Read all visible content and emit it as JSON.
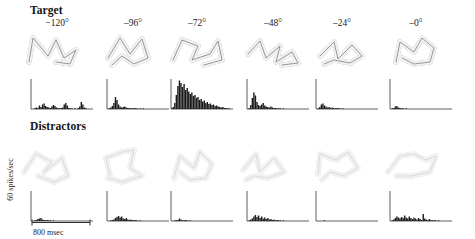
{
  "figure": {
    "width": 475,
    "height": 239,
    "background": "#ffffff"
  },
  "rows": [
    {
      "id": "target",
      "title": "Target",
      "title_x": 30,
      "title_y": 4
    },
    {
      "id": "distractors",
      "title": "Distractors",
      "title_x": 30,
      "title_y": 120
    }
  ],
  "angles": [
    "−120°",
    "–96°",
    "–72°",
    "–48°",
    "–24°",
    "–0°"
  ],
  "column_centers": [
    57,
    133,
    197,
    273,
    342,
    416
  ],
  "axes": {
    "y_label": "60 spikes/sec",
    "x_label": "800 msec",
    "y_label_color": "#1a1a1a",
    "x_label_color": "#1a1a1a"
  },
  "colors": {
    "target_shape_stroke": "#4a4a4a",
    "distractor_shape_stroke": "#b4b4b4",
    "shape_fill": "#f2f2f2",
    "histogram_fill": "#1b1b1b",
    "axis_stroke": "#4d4d4d"
  },
  "chart_data": {
    "type": "bar",
    "xlabel": "800 msec",
    "ylabel": "60 spikes/sec",
    "categories": [
      "−120°",
      "–96°",
      "–72°",
      "–48°",
      "–24°",
      "–0°"
    ],
    "ylim": [
      0,
      60
    ],
    "xlim": [
      0,
      800
    ],
    "grid": false,
    "legend": "none",
    "bin_count": 40,
    "panels": [
      {
        "row": "Target",
        "angle": "−120°",
        "peak_rate": 17,
        "values": [
          0,
          0,
          1,
          3,
          2,
          7,
          4,
          9,
          11,
          6,
          4,
          3,
          2,
          5,
          8,
          6,
          3,
          2,
          1,
          2,
          3,
          9,
          12,
          7,
          2,
          1,
          1,
          0,
          1,
          0,
          2,
          5,
          14,
          9,
          3,
          1,
          0,
          0,
          0,
          0
        ]
      },
      {
        "row": "Target",
        "angle": "–96°",
        "peak_rate": 26,
        "values": [
          0,
          1,
          3,
          6,
          12,
          24,
          18,
          9,
          5,
          3,
          4,
          5,
          3,
          2,
          2,
          1,
          1,
          2,
          1,
          1,
          0,
          1,
          0,
          1,
          0,
          0,
          0,
          0,
          0,
          0,
          0,
          0,
          0,
          0,
          0,
          0,
          0,
          0,
          0,
          0
        ]
      },
      {
        "row": "Target",
        "angle": "–72°",
        "peak_rate": 58,
        "values": [
          1,
          4,
          12,
          28,
          46,
          57,
          52,
          44,
          50,
          38,
          42,
          35,
          30,
          33,
          26,
          28,
          22,
          24,
          18,
          20,
          15,
          17,
          12,
          14,
          10,
          11,
          8,
          9,
          6,
          7,
          5,
          4,
          3,
          4,
          2,
          2,
          1,
          1,
          0,
          0
        ]
      },
      {
        "row": "Target",
        "angle": "–48°",
        "peak_rate": 33,
        "values": [
          0,
          2,
          8,
          22,
          33,
          27,
          14,
          8,
          6,
          9,
          12,
          7,
          5,
          4,
          3,
          5,
          3,
          2,
          2,
          1,
          1,
          1,
          0,
          1,
          0,
          0,
          0,
          0,
          0,
          0,
          0,
          0,
          0,
          0,
          0,
          0,
          0,
          0,
          0,
          0
        ]
      },
      {
        "row": "Target",
        "angle": "–24°",
        "peak_rate": 11,
        "values": [
          0,
          1,
          4,
          9,
          11,
          7,
          5,
          3,
          4,
          2,
          3,
          2,
          1,
          2,
          1,
          1,
          0,
          1,
          0,
          0,
          0,
          0,
          0,
          0,
          0,
          0,
          0,
          0,
          0,
          0,
          0,
          0,
          0,
          0,
          0,
          0,
          0,
          0,
          0,
          0
        ]
      },
      {
        "row": "Target",
        "angle": "–0°",
        "peak_rate": 6,
        "values": [
          0,
          1,
          2,
          5,
          6,
          3,
          2,
          1,
          1,
          0,
          1,
          0,
          0,
          0,
          0,
          0,
          0,
          0,
          0,
          0,
          0,
          0,
          0,
          0,
          0,
          0,
          0,
          0,
          0,
          0,
          0,
          0,
          0,
          0,
          0,
          0,
          0,
          0,
          0,
          0
        ]
      },
      {
        "row": "Distractors",
        "angle": "−120°",
        "peak_rate": 6,
        "values": [
          0,
          0,
          1,
          2,
          4,
          5,
          6,
          3,
          2,
          1,
          2,
          1,
          1,
          0,
          1,
          0,
          0,
          0,
          0,
          0,
          0,
          0,
          0,
          0,
          0,
          0,
          0,
          0,
          0,
          0,
          0,
          0,
          0,
          0,
          0,
          0,
          0,
          0,
          0,
          0
        ]
      },
      {
        "row": "Distractors",
        "angle": "–96°",
        "peak_rate": 10,
        "values": [
          0,
          0,
          1,
          2,
          3,
          6,
          8,
          10,
          7,
          9,
          5,
          4,
          6,
          3,
          2,
          3,
          1,
          2,
          1,
          1,
          0,
          1,
          0,
          0,
          0,
          0,
          0,
          0,
          0,
          0,
          0,
          0,
          0,
          0,
          0,
          0,
          0,
          0,
          0,
          0
        ]
      },
      {
        "row": "Distractors",
        "angle": "–72°",
        "peak_rate": 5,
        "values": [
          0,
          0,
          1,
          1,
          2,
          5,
          3,
          1,
          1,
          2,
          1,
          0,
          1,
          0,
          0,
          0,
          0,
          0,
          0,
          0,
          0,
          0,
          0,
          0,
          0,
          0,
          0,
          0,
          0,
          0,
          0,
          0,
          0,
          0,
          0,
          0,
          0,
          0,
          0,
          0
        ]
      },
      {
        "row": "Distractors",
        "angle": "–48°",
        "peak_rate": 12,
        "values": [
          0,
          1,
          3,
          5,
          9,
          12,
          8,
          11,
          6,
          9,
          5,
          7,
          4,
          6,
          3,
          4,
          2,
          3,
          1,
          2,
          1,
          1,
          0,
          1,
          0,
          0,
          0,
          0,
          0,
          0,
          0,
          0,
          0,
          0,
          0,
          0,
          0,
          0,
          0,
          0
        ]
      },
      {
        "row": "Distractors",
        "angle": "–24°",
        "peak_rate": 1,
        "values": [
          0,
          0,
          0,
          0,
          0,
          1,
          0,
          0,
          0,
          0,
          0,
          0,
          0,
          0,
          0,
          0,
          0,
          0,
          0,
          0,
          0,
          0,
          0,
          0,
          0,
          0,
          0,
          0,
          0,
          0,
          0,
          0,
          0,
          0,
          0,
          0,
          0,
          0,
          0,
          0
        ]
      },
      {
        "row": "Distractors",
        "angle": "–0°",
        "peak_rate": 14,
        "values": [
          0,
          1,
          3,
          6,
          9,
          7,
          5,
          8,
          6,
          11,
          7,
          5,
          9,
          6,
          4,
          7,
          5,
          3,
          6,
          4,
          2,
          14,
          5,
          3,
          2,
          4,
          2,
          1,
          1,
          1,
          0,
          1,
          0,
          0,
          0,
          0,
          0,
          0,
          0,
          0
        ]
      }
    ]
  },
  "stimuli": [
    {
      "row": "target",
      "angle": "−120°",
      "name": "wireframe-object-target-120"
    },
    {
      "row": "target",
      "angle": "–96°",
      "name": "wireframe-object-target-96"
    },
    {
      "row": "target",
      "angle": "–72°",
      "name": "wireframe-object-target-72"
    },
    {
      "row": "target",
      "angle": "–48°",
      "name": "wireframe-object-target-48"
    },
    {
      "row": "target",
      "angle": "–24°",
      "name": "wireframe-object-target-24"
    },
    {
      "row": "target",
      "angle": "–0°",
      "name": "wireframe-object-target-0"
    },
    {
      "row": "distractors",
      "angle": "−120°",
      "name": "wireframe-object-distractor-1"
    },
    {
      "row": "distractors",
      "angle": "–96°",
      "name": "wireframe-object-distractor-2"
    },
    {
      "row": "distractors",
      "angle": "–72°",
      "name": "wireframe-object-distractor-3"
    },
    {
      "row": "distractors",
      "angle": "–48°",
      "name": "wireframe-object-distractor-4"
    },
    {
      "row": "distractors",
      "angle": "–24°",
      "name": "wireframe-object-distractor-5"
    },
    {
      "row": "distractors",
      "angle": "–0°",
      "name": "wireframe-object-distractor-6"
    }
  ]
}
